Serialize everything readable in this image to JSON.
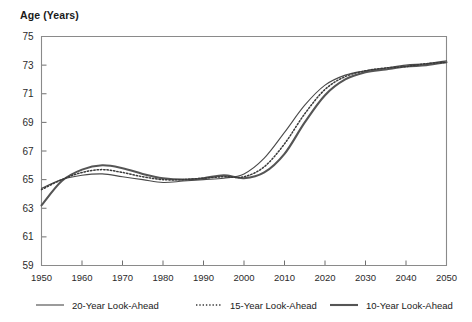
{
  "chart_data": {
    "type": "line",
    "title": "Age (Years)",
    "xlabel": "",
    "ylabel": "Age (Years)",
    "xlim": [
      1950,
      2050
    ],
    "ylim": [
      59,
      75
    ],
    "grid": false,
    "legend_position": "bottom",
    "xticks": [
      1950,
      1960,
      1970,
      1980,
      1990,
      2000,
      2010,
      2020,
      2030,
      2040,
      2050
    ],
    "yticks": [
      59,
      61,
      63,
      65,
      67,
      69,
      71,
      73,
      75
    ],
    "x": [
      1950,
      1955,
      1960,
      1965,
      1970,
      1975,
      1980,
      1985,
      1990,
      1995,
      2000,
      2005,
      2010,
      2015,
      2020,
      2025,
      2030,
      2035,
      2040,
      2045,
      2050
    ],
    "series": [
      {
        "name": "20-Year Look-Ahead",
        "style": "solid-thin",
        "values": [
          64.4,
          65.0,
          65.3,
          65.4,
          65.2,
          65.0,
          64.8,
          64.9,
          65.0,
          65.1,
          65.4,
          66.5,
          68.3,
          70.2,
          71.6,
          72.3,
          72.6,
          72.8,
          73.0,
          73.1,
          73.3
        ]
      },
      {
        "name": "15-Year Look-Ahead",
        "style": "dotted",
        "values": [
          64.3,
          65.0,
          65.5,
          65.7,
          65.5,
          65.2,
          65.0,
          65.0,
          65.1,
          65.2,
          65.2,
          65.9,
          67.5,
          69.6,
          71.3,
          72.2,
          72.6,
          72.8,
          72.9,
          73.1,
          73.2
        ]
      },
      {
        "name": "10-Year Look-Ahead",
        "style": "solid-thick",
        "values": [
          63.2,
          64.9,
          65.7,
          66.0,
          65.8,
          65.4,
          65.1,
          65.0,
          65.1,
          65.3,
          65.1,
          65.5,
          66.8,
          69.0,
          70.9,
          72.0,
          72.5,
          72.7,
          72.9,
          73.0,
          73.2
        ]
      }
    ]
  },
  "legend": {
    "items": [
      {
        "label": "20-Year Look-Ahead"
      },
      {
        "label": "15-Year Look-Ahead"
      },
      {
        "label": "10-Year Look-Ahead"
      }
    ]
  }
}
